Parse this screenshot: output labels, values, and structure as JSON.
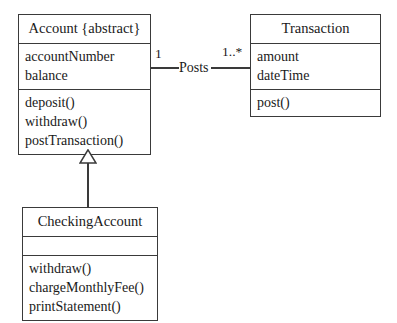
{
  "diagram": {
    "type": "uml-class-diagram",
    "classes": [
      {
        "id": "account",
        "name": "Account {abstract}",
        "is_abstract": true,
        "attributes": [
          "accountNumber",
          "balance"
        ],
        "operations": [
          "deposit()",
          "withdraw()",
          "postTransaction()"
        ]
      },
      {
        "id": "transaction",
        "name": "Transaction",
        "is_abstract": false,
        "attributes": [
          "amount",
          "dateTime"
        ],
        "operations": [
          "post()"
        ]
      },
      {
        "id": "checkingaccount",
        "name": "CheckingAccount",
        "is_abstract": false,
        "attributes": [],
        "operations": [
          "withdraw()",
          "chargeMonthlyFee()",
          "printStatement()"
        ]
      }
    ],
    "relationships": [
      {
        "id": "posts",
        "kind": "association",
        "label": "Posts",
        "source": "account",
        "target": "transaction",
        "source_multiplicity": "1",
        "target_multiplicity": "1..*"
      },
      {
        "id": "generalization",
        "kind": "generalization",
        "label": "",
        "source": "checkingaccount",
        "target": "account"
      }
    ]
  },
  "colors": {
    "background": "#ffffff",
    "line": "#3a3a3a",
    "text": "#1a1a1a"
  }
}
